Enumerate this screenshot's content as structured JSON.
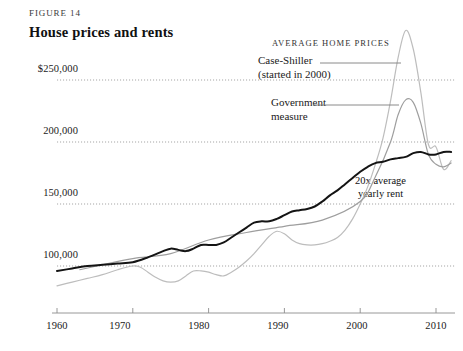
{
  "figure": {
    "label": "FIGURE 14",
    "title": "House prices and rents"
  },
  "legend": {
    "heading": "AVERAGE HOME PRICES",
    "items": [
      {
        "name": "case-shiller",
        "line1": "Case-Shiller",
        "line2": "(started in 2000)",
        "color": "#b9b9b9"
      },
      {
        "name": "government-measure",
        "line1": "Government",
        "line2": "measure",
        "color": "#9a9a9a"
      }
    ]
  },
  "annotation": {
    "line1": "20x average",
    "line2": "yearly rent",
    "color": "#141414"
  },
  "axes": {
    "y_labels": [
      "$250,000",
      "200,000",
      "150,000",
      "100,000"
    ],
    "x_labels": [
      "1960",
      "1970",
      "1980",
      "1990",
      "2000",
      "2010"
    ]
  },
  "chart_data": {
    "type": "line",
    "title": "House prices and rents",
    "subtitle": "FIGURE 14",
    "xlabel": "",
    "ylabel": "",
    "xlim": [
      1960,
      2012
    ],
    "ylim": [
      75000,
      300000
    ],
    "yticks": [
      100000,
      150000,
      200000,
      250000
    ],
    "ytick_labels": [
      "100,000",
      "150,000",
      "200,000",
      "$250,000"
    ],
    "xticks": [
      1960,
      1970,
      1980,
      1990,
      2000,
      2010
    ],
    "grid": "horizontal-dotted",
    "legend_position": "upper-right-inline",
    "units": "US dollars (inflation adjusted)",
    "series": [
      {
        "name": "Case-Shiller",
        "note": "(started in 2000)",
        "color": "#bdbdbd",
        "width": 1.2,
        "x": [
          1960,
          1962,
          1964,
          1966,
          1968,
          1970,
          1971,
          1972,
          1973,
          1974,
          1975,
          1976,
          1977,
          1978,
          1979,
          1980,
          1981,
          1982,
          1983,
          1984,
          1985,
          1986,
          1987,
          1988,
          1989,
          1990,
          1991,
          1992,
          1993,
          1994,
          1995,
          1996,
          1997,
          1998,
          1999,
          2000,
          2001,
          2002,
          2003,
          2004,
          2005,
          2006,
          2007,
          2008,
          2009,
          2010,
          2011,
          2012
        ],
        "y": [
          84000,
          87000,
          90000,
          93000,
          97000,
          100000,
          99000,
          95000,
          91000,
          88000,
          87000,
          88000,
          92000,
          96000,
          96000,
          95000,
          93000,
          92000,
          95000,
          99000,
          104000,
          110000,
          117000,
          124000,
          128000,
          126000,
          121000,
          118000,
          117000,
          117000,
          118000,
          120000,
          123000,
          129000,
          138000,
          150000,
          164000,
          182000,
          203000,
          233000,
          268000,
          290000,
          275000,
          240000,
          198000,
          196000,
          178000,
          185000
        ]
      },
      {
        "name": "Government measure",
        "color": "#9e9e9e",
        "width": 1.2,
        "x": [
          1963,
          1966,
          1970,
          1975,
          1980,
          1985,
          1990,
          1995,
          2000,
          2002,
          2004,
          2005,
          2006,
          2007,
          2008,
          2009,
          2010,
          2011,
          2012
        ],
        "y": [
          97000,
          101000,
          106000,
          110000,
          121000,
          127000,
          132000,
          137000,
          152000,
          172000,
          200000,
          222000,
          234000,
          232000,
          215000,
          190000,
          182000,
          180000,
          183000
        ]
      },
      {
        "name": "20x average yearly rent",
        "color": "#141414",
        "width": 2.0,
        "x": [
          1960,
          1962,
          1964,
          1966,
          1968,
          1970,
          1972,
          1974,
          1975,
          1976,
          1977,
          1978,
          1979,
          1980,
          1981,
          1982,
          1983,
          1984,
          1985,
          1986,
          1987,
          1988,
          1989,
          1990,
          1991,
          1992,
          1993,
          1994,
          1995,
          1996,
          1997,
          1998,
          1999,
          2000,
          2001,
          2002,
          2003,
          2004,
          2005,
          2006,
          2007,
          2008,
          2009,
          2010,
          2011,
          2012
        ],
        "y": [
          96000,
          98000,
          100000,
          101000,
          102000,
          103000,
          107000,
          112000,
          114000,
          113000,
          112000,
          114000,
          117000,
          117000,
          117000,
          119000,
          123000,
          127000,
          131000,
          135000,
          136000,
          136000,
          138000,
          141000,
          144000,
          145000,
          146000,
          148000,
          152000,
          157000,
          161000,
          166000,
          171000,
          176000,
          180000,
          183000,
          184000,
          186000,
          187000,
          188000,
          191000,
          192000,
          190000,
          190000,
          192000,
          192000
        ]
      }
    ],
    "annotations": [
      {
        "text": "20x average yearly rent",
        "target_series": "20x average yearly rent",
        "x": 2003
      },
      {
        "text": "AVERAGE HOME PRICES",
        "type": "legend-heading"
      }
    ]
  },
  "colors": {
    "background": "#ffffff",
    "text": "#1a1a1a",
    "axis": "#8c8c8c",
    "grid": "#9b9b9b"
  }
}
